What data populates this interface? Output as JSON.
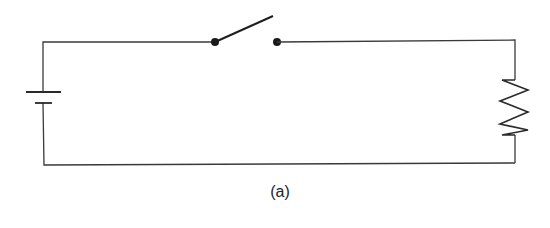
{
  "figure": {
    "caption": "(a)"
  },
  "components": [
    {
      "type": "battery",
      "label": "",
      "position": "left side"
    },
    {
      "type": "switch",
      "state": "open",
      "label": "",
      "position": "top wire"
    },
    {
      "type": "resistor",
      "label": "",
      "position": "right side"
    }
  ],
  "colors": {
    "wire": "#3a3a3a",
    "background": "#ffffff"
  }
}
